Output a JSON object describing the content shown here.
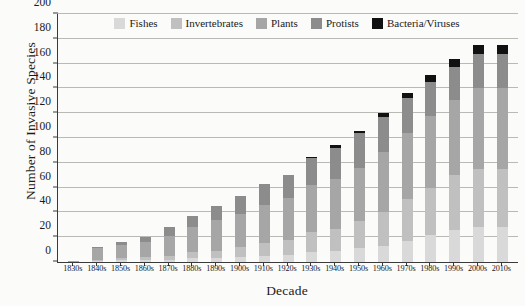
{
  "chart_data": {
    "type": "bar",
    "stacked": true,
    "title": "",
    "xlabel": "Decade",
    "ylabel": "Number of Invasive Species",
    "ylim": [
      0,
      200
    ],
    "ytick_step": 20,
    "yticks": [
      0,
      20,
      40,
      60,
      80,
      100,
      120,
      140,
      160,
      180,
      200
    ],
    "grid": "horizontal",
    "legend_position": "top-center",
    "categories": [
      "1830s",
      "1840s",
      "1850s",
      "1860s",
      "1870s",
      "1880s",
      "1890s",
      "1900s",
      "1910s",
      "1920s",
      "1930s",
      "1940s",
      "1950s",
      "1960s",
      "1970s",
      "1980s",
      "1990s",
      "2000s",
      "2010s"
    ],
    "series": [
      {
        "name": "Fishes",
        "color": "#d9d9d9",
        "values": [
          0,
          1,
          2,
          2,
          2,
          3,
          3,
          4,
          5,
          6,
          8,
          9,
          11,
          13,
          17,
          22,
          26,
          28,
          28
        ]
      },
      {
        "name": "Invertebrates",
        "color": "#c0c0c0",
        "values": [
          0,
          1,
          1,
          2,
          3,
          5,
          6,
          8,
          10,
          12,
          16,
          18,
          22,
          27,
          34,
          38,
          44,
          47,
          47
        ]
      },
      {
        "name": "Plants",
        "color": "#a6a6a6",
        "values": [
          1,
          9,
          11,
          12,
          16,
          20,
          25,
          27,
          31,
          34,
          38,
          40,
          43,
          49,
          53,
          58,
          61,
          65,
          65
        ]
      },
      {
        "name": "Protists",
        "color": "#8c8c8c",
        "values": [
          0,
          1,
          2,
          4,
          7,
          9,
          11,
          14,
          17,
          18,
          22,
          25,
          28,
          28,
          28,
          27,
          26,
          28,
          28
        ]
      },
      {
        "name": "Bacteria/Viruses",
        "color": "#111111",
        "values": [
          0,
          0,
          0,
          0,
          0,
          0,
          0,
          0,
          0,
          0,
          1,
          2,
          2,
          3,
          4,
          6,
          7,
          7,
          7
        ]
      }
    ],
    "totals": [
      1,
      12,
      16,
      20,
      28,
      37,
      45,
      53,
      63,
      70,
      85,
      94,
      106,
      120,
      136,
      151,
      164,
      175,
      175
    ]
  },
  "legend": {
    "items": [
      {
        "label": "Fishes"
      },
      {
        "label": "Invertebrates"
      },
      {
        "label": "Plants"
      },
      {
        "label": "Protists"
      },
      {
        "label": "Bacteria/Viruses"
      }
    ]
  },
  "axes": {
    "y_title": "Number of Invasive Species",
    "x_title": "Decade"
  }
}
